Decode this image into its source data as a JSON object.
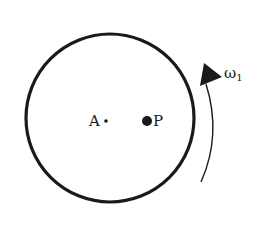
{
  "diagram": {
    "type": "rotating-disk",
    "labels": {
      "center": "A",
      "point": "P",
      "omega_symbol": "ω",
      "omega_subscript": "1"
    },
    "colors": {
      "stroke": "#1a1a1a",
      "background": "#ffffff"
    }
  }
}
